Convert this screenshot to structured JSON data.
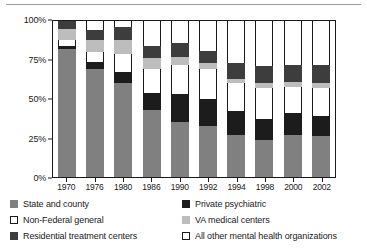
{
  "chart_data": {
    "type": "bar",
    "title": "",
    "subtitle": "",
    "xlabel": "",
    "ylabel": "",
    "stacked": true,
    "stack_percent": true,
    "grid": false,
    "legend_position": "bottom",
    "ylim": [
      0,
      100
    ],
    "yticks": [
      "0%",
      "25%",
      "50%",
      "75%",
      "100%"
    ],
    "ytick_values": [
      0,
      25,
      50,
      75,
      100
    ],
    "categories": [
      "1970",
      "1976",
      "1980",
      "1986",
      "1990",
      "1992",
      "1994",
      "1998",
      "2000",
      "2002"
    ],
    "series": [
      {
        "name": "State and county",
        "color": "#808080",
        "values": [
          82,
          69,
          60,
          43,
          35,
          33,
          27,
          24,
          27,
          26
        ]
      },
      {
        "name": "Private psychiatric",
        "color": "#1c1c1c",
        "values": [
          2,
          5,
          7,
          11,
          18,
          17,
          15,
          13,
          14,
          13
        ]
      },
      {
        "name": "Non-Federal general",
        "color": "#ffffff",
        "values": [
          4,
          6,
          12,
          15,
          19,
          19,
          18,
          20,
          17,
          18
        ]
      },
      {
        "name": "VA medical centers",
        "color": "#bdbdbd",
        "values": [
          7,
          8,
          9,
          7,
          5,
          4,
          3,
          3,
          3,
          3
        ]
      },
      {
        "name": "Residential treatment centers",
        "color": "#3d3d3d",
        "values": [
          5,
          6,
          8,
          8,
          9,
          8,
          10,
          11,
          11,
          12
        ]
      },
      {
        "name": "All other mental health organizations",
        "color": "#ffffff",
        "values": [
          0,
          6,
          4,
          16,
          14,
          19,
          27,
          29,
          28,
          28
        ]
      }
    ]
  },
  "legend": {
    "items": [
      {
        "label": "State and county",
        "swatch": "sw-state"
      },
      {
        "label": "Private psychiatric",
        "swatch": "sw-private"
      },
      {
        "label": "Non-Federal general",
        "swatch": "sw-nonfed"
      },
      {
        "label": "VA medical centers",
        "swatch": "sw-va"
      },
      {
        "label": "Residential treatment centers",
        "swatch": "sw-res"
      },
      {
        "label": "All other mental health organizations",
        "swatch": "sw-other"
      }
    ]
  }
}
